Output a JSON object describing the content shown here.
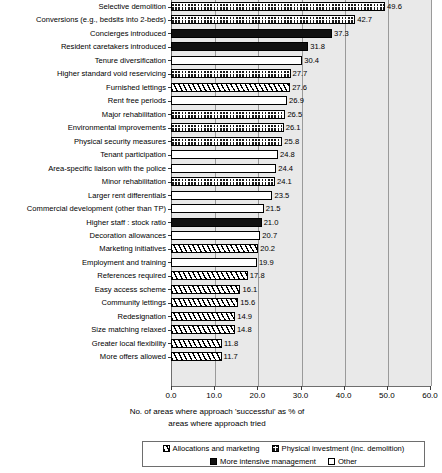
{
  "chart_data": {
    "type": "bar",
    "orientation": "horizontal",
    "title": "",
    "xlabel": "No. of areas where approach 'successful' as % of areas where approach tried",
    "xlabel_lines": [
      "No. of areas where approach 'successful' as % of",
      "areas where approach tried"
    ],
    "ylabel": "",
    "xlim": [
      0.0,
      60.0
    ],
    "xticks": [
      0.0,
      10.0,
      20.0,
      30.0,
      40.0,
      50.0,
      60.0
    ],
    "xtick_labels": [
      "0.0",
      "10.0",
      "20.0",
      "30.0",
      "40.0",
      "50.0",
      "60.0"
    ],
    "grid": true,
    "grid_axis": "x",
    "legend_position": "bottom",
    "categories": [
      "Selective demolition",
      "Conversions (e.g., bedsits into 2-beds)",
      "Concierges introduced",
      "Resident caretakers introduced",
      "Tenure diversification",
      "Higher standard void reservicing",
      "Furnished lettings",
      "Rent free periods",
      "Major rehabilitation",
      "Environmental improvements",
      "Physical security measures",
      "Tenant participation",
      "Area-specific liaison with the police",
      "Minor rehabilitation",
      "Larger rent differentials",
      "Commercial development (other than TP)",
      "Higher staff : stock ratio",
      "Decoration allowances",
      "Marketing initiatives",
      "Employment and training",
      "References required",
      "Easy access scheme",
      "Community lettings",
      "Redesignation",
      "Size matching relaxed",
      "Greater local flexibility",
      "More offers allowed"
    ],
    "values": [
      49.6,
      42.7,
      37.3,
      31.8,
      30.4,
      27.7,
      27.6,
      26.9,
      26.5,
      26.1,
      25.8,
      24.8,
      24.4,
      24.1,
      23.5,
      21.5,
      21.0,
      20.7,
      20.2,
      19.9,
      17.8,
      16.1,
      15.6,
      14.9,
      14.8,
      11.8,
      11.7
    ],
    "value_labels": [
      "49.6",
      "42.7",
      "37.3",
      "31.8",
      "30.4",
      "27.7",
      "27.6",
      "26.9",
      "26.5",
      "26.1",
      "25.8",
      "24.8",
      "24.4",
      "24.1",
      "23.5",
      "21.5",
      "21.0",
      "20.7",
      "20.2",
      "19.9",
      "17.8",
      "16.1",
      "15.6",
      "14.9",
      "14.8",
      "11.8",
      "11.7"
    ],
    "series_keys": [
      "phys",
      "phys",
      "mim",
      "mim",
      "other",
      "phys",
      "alloc",
      "other",
      "phys",
      "phys",
      "phys",
      "other",
      "other",
      "phys",
      "other",
      "other",
      "mim",
      "other",
      "alloc",
      "other",
      "alloc",
      "alloc",
      "alloc",
      "alloc",
      "alloc",
      "alloc",
      "alloc"
    ]
  },
  "legend": {
    "rows": [
      [
        {
          "key": "alloc",
          "label": "Allocations and marketing"
        },
        {
          "key": "phys",
          "label": "Physical investment (inc. demolition)"
        }
      ],
      [
        {
          "key": "mim",
          "label": "More intensive management"
        },
        {
          "key": "other",
          "label": "Other"
        }
      ]
    ]
  },
  "colors": {
    "plot_background": "#e9e9e9",
    "page_background": "#ffffff",
    "axis": "#6e6e6e",
    "gridline": "#9a9a9a",
    "bar_outline": "#000000",
    "solid_fill": "#111111",
    "text": "#000000"
  }
}
